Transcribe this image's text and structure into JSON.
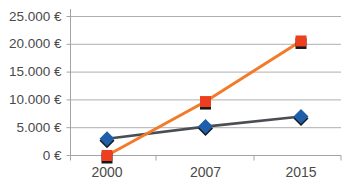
{
  "chart_data": {
    "type": "line",
    "title": "",
    "xlabel": "",
    "ylabel": "",
    "categories": [
      "2000",
      "2007",
      "2015"
    ],
    "ylim": [
      0,
      25000
    ],
    "ytick_values": [
      0,
      5000,
      10000,
      15000,
      20000,
      25000
    ],
    "ytick_labels": [
      "0 €",
      "5.000 €",
      "10.000 €",
      "15.000 €",
      "20.000 €",
      "25.000 €"
    ],
    "grid": "horizontal",
    "legend": "none",
    "currency_symbol": "€",
    "number_format": "de-DE",
    "series": [
      {
        "name": "series-blue",
        "marker": "diamond",
        "marker_color": "#1f5fa9",
        "line_color": "#4a4e52",
        "values": [
          3000,
          5200,
          7000
        ],
        "value_labels": [
          "3.000 €",
          "5.200 €",
          "7.000 €"
        ]
      },
      {
        "name": "series-red",
        "marker": "square",
        "marker_color": "#ee3e20",
        "line_color": "#f37a29",
        "values": [
          0,
          9700,
          20600
        ],
        "value_labels": [
          "0 €",
          "9.700 €",
          "20.600 €"
        ]
      }
    ]
  },
  "colors": {
    "blue_marker": "#1f5fa9",
    "red_marker": "#ee3e20",
    "orange_line": "#f37a29",
    "gray_line": "#4a4e52",
    "gridline": "#9a9a9a",
    "axis_text": "#4a4a4a",
    "background": "#ffffff"
  }
}
